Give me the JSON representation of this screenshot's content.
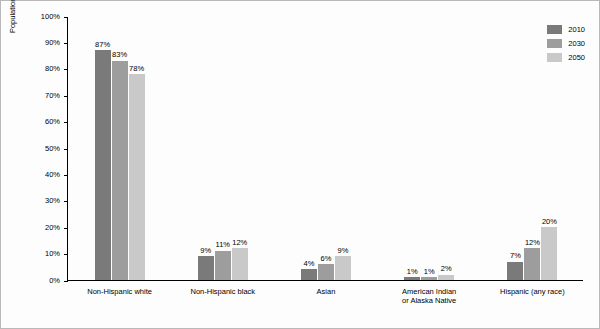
{
  "chart_data": {
    "type": "bar",
    "title": "",
    "xlabel": "",
    "ylabel": "Population aged 65 or older",
    "ylim": [
      0,
      100
    ],
    "yticks": [
      "0%",
      "10%",
      "20%",
      "30%",
      "40%",
      "50%",
      "60%",
      "70%",
      "80%",
      "90%",
      "100%"
    ],
    "grid": false,
    "legend_position": "top-right",
    "categories": [
      "Non-Hispanic white",
      "Non-Hispanic black",
      "Asian",
      "American Indian\nor Alaska Native",
      "Hispanic (any race)"
    ],
    "category_lines": [
      [
        "Non-Hispanic white"
      ],
      [
        "Non-Hispanic black"
      ],
      [
        "Asian"
      ],
      [
        "American Indian",
        "or Alaska Native"
      ],
      [
        "Hispanic (any race)"
      ]
    ],
    "series": [
      {
        "name": "2010",
        "color": "#7a7a7a",
        "values": [
          87,
          9,
          4,
          1,
          7
        ],
        "labels": [
          "87%",
          "9%",
          "4%",
          "1%",
          "7%"
        ]
      },
      {
        "name": "2030",
        "color": "#9d9d9d",
        "values": [
          83,
          11,
          6,
          1,
          12
        ],
        "labels": [
          "83%",
          "11%",
          "6%",
          "1%",
          "12%"
        ]
      },
      {
        "name": "2050",
        "color": "#c9c9c9",
        "values": [
          78,
          12,
          9,
          2,
          20
        ],
        "labels": [
          "78%",
          "12%",
          "9%",
          "2%",
          "20%"
        ]
      }
    ]
  }
}
